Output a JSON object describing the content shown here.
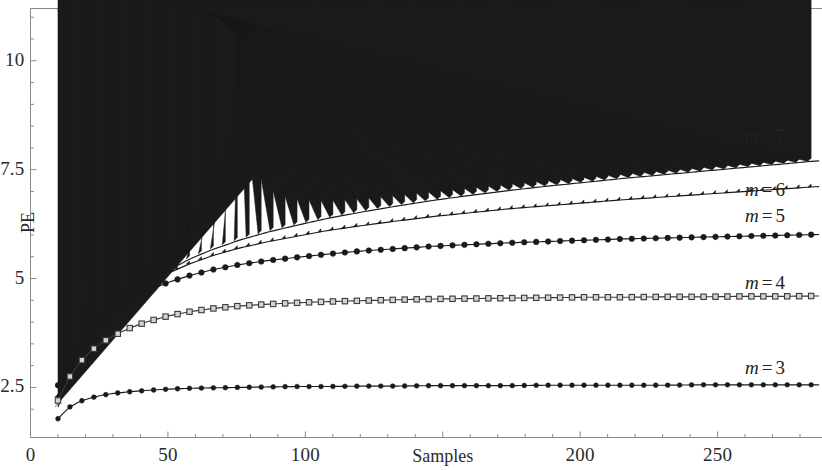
{
  "chart_data": {
    "type": "line",
    "title": "",
    "xlabel": "Samples",
    "ylabel": "PE",
    "xlim": [
      0,
      288
    ],
    "ylim": [
      1.35,
      11.2
    ],
    "grid": false,
    "legend_position": "inline-right",
    "x_ticks": [
      {
        "value": 0,
        "label": "0"
      },
      {
        "value": 50,
        "label": "50"
      },
      {
        "value": 100,
        "label": "100"
      },
      {
        "value": 150,
        "label": ""
      },
      {
        "value": 200,
        "label": "200"
      },
      {
        "value": 250,
        "label": "250"
      }
    ],
    "y_ticks": [
      {
        "value": 2.5,
        "label": "2.5"
      },
      {
        "value": 5,
        "label": "5"
      },
      {
        "value": 7.5,
        "label": "7.5"
      },
      {
        "value": 10,
        "label": "10"
      }
    ],
    "x": [
      10,
      14,
      18,
      22,
      26,
      30,
      36,
      42,
      50,
      58,
      66,
      76,
      86,
      96,
      108,
      120,
      132,
      146,
      160,
      174,
      188,
      202,
      216,
      230,
      244,
      258,
      272,
      286
    ],
    "series": [
      {
        "name": "m = 7",
        "label_m": "m",
        "label_eq": "=",
        "label_value": "7",
        "marker": "triangle-up",
        "color": "#1a1a1a",
        "annotation": {
          "x": 268,
          "y": 8.25
        },
        "values": [
          2.05,
          2.7,
          3.2,
          3.62,
          3.95,
          4.22,
          4.57,
          4.85,
          5.18,
          5.45,
          5.66,
          5.88,
          6.06,
          6.21,
          6.38,
          6.52,
          6.65,
          6.79,
          6.91,
          7.02,
          7.12,
          7.21,
          7.3,
          7.38,
          7.46,
          7.54,
          7.62,
          7.7
        ]
      },
      {
        "name": "m = 6",
        "label_m": "m",
        "label_eq": "=",
        "label_value": "6",
        "marker": "diamond",
        "color": "#1a1a1a",
        "annotation": {
          "x": 268,
          "y": 7.02
        },
        "values": [
          2.28,
          2.92,
          3.4,
          3.78,
          4.06,
          4.3,
          4.6,
          4.84,
          5.12,
          5.34,
          5.52,
          5.7,
          5.84,
          5.96,
          6.1,
          6.21,
          6.31,
          6.42,
          6.51,
          6.6,
          6.67,
          6.74,
          6.81,
          6.87,
          6.93,
          6.99,
          7.05,
          7.11
        ]
      },
      {
        "name": "m = 5",
        "label_m": "m",
        "label_eq": "=",
        "label_value": "5",
        "marker": "circle",
        "color": "#1a1a1a",
        "annotation": {
          "x": 268,
          "y": 6.42
        },
        "values": [
          2.55,
          3.1,
          3.52,
          3.84,
          4.08,
          4.27,
          4.51,
          4.7,
          4.91,
          5.07,
          5.2,
          5.32,
          5.41,
          5.48,
          5.56,
          5.63,
          5.68,
          5.74,
          5.78,
          5.82,
          5.85,
          5.88,
          5.91,
          5.93,
          5.95,
          5.97,
          5.99,
          6.01
        ]
      },
      {
        "name": "m = 4",
        "label_m": "m",
        "label_eq": "=",
        "label_value": "4",
        "marker": "square",
        "color": "#3a3a3a",
        "annotation": {
          "x": 268,
          "y": 4.87
        },
        "values": [
          2.2,
          2.72,
          3.08,
          3.34,
          3.53,
          3.68,
          3.86,
          4.0,
          4.14,
          4.24,
          4.31,
          4.37,
          4.41,
          4.44,
          4.47,
          4.49,
          4.51,
          4.53,
          4.54,
          4.55,
          4.56,
          4.57,
          4.57,
          4.58,
          4.58,
          4.59,
          4.59,
          4.6
        ]
      },
      {
        "name": "m = 3",
        "label_m": "m",
        "label_eq": "=",
        "label_value": "3",
        "marker": "circle-small",
        "color": "#1a1a1a",
        "annotation": {
          "x": 268,
          "y": 2.93
        },
        "values": [
          1.78,
          2.04,
          2.18,
          2.26,
          2.32,
          2.36,
          2.4,
          2.43,
          2.46,
          2.48,
          2.49,
          2.5,
          2.51,
          2.52,
          2.52,
          2.53,
          2.53,
          2.54,
          2.54,
          2.54,
          2.55,
          2.55,
          2.55,
          2.55,
          2.56,
          2.56,
          2.56,
          2.56
        ]
      }
    ]
  },
  "axes": {
    "y_title": "PE",
    "x_title": "Samples"
  },
  "colors": {
    "frame": "#8a8a8a",
    "ink": "#1a1a1a",
    "background": "#ffffff"
  }
}
